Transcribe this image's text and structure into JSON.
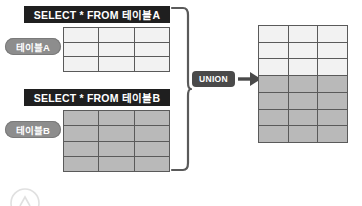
{
  "diagram": {
    "colors": {
      "bar_bg": "#1f1f1f",
      "bar_text": "#ffffff",
      "pill_bg": "#8d8d8d",
      "grid_line": "#5a5a5a",
      "cell_light": "#f2f2f2",
      "cell_shaded": "#b9b9b9",
      "badge_bg": "#4a4a4a",
      "arrow": "#4a4a4a",
      "bracket": "#5a5a5a"
    },
    "queries": [
      {
        "id": "a",
        "statement": "SELECT * FROM 테이블A",
        "pill_label": "테이블A",
        "rows": 3,
        "cols": 3,
        "shaded": false
      },
      {
        "id": "b",
        "statement": "SELECT * FROM 테이블B",
        "pill_label": "테이블B",
        "rows": 4,
        "cols": 3,
        "shaded": true
      }
    ],
    "operator": {
      "label": "UNION",
      "arrow_glyph": "→"
    },
    "result": {
      "cols": 3,
      "light_rows": 3,
      "shaded_rows": 4,
      "total_rows": 7
    }
  }
}
